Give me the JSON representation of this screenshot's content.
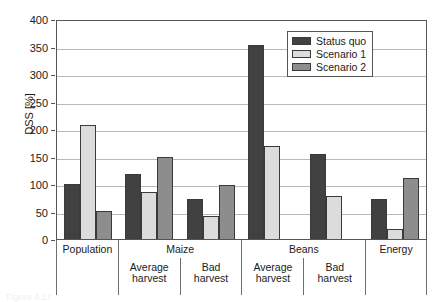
{
  "chart_data": {
    "type": "bar",
    "title": "",
    "xlabel": "",
    "ylabel": "DSS [%]",
    "ylim": [
      0,
      400
    ],
    "yticks": [
      0,
      50,
      100,
      150,
      200,
      250,
      300,
      350,
      400
    ],
    "ytick_labels": [
      "0",
      "50",
      "100",
      "150",
      "200",
      "250",
      "300",
      "350",
      "400"
    ],
    "grid": true,
    "legend_position": "top-right",
    "categories": [
      "Population",
      "Maize – Average harvest",
      "Maize – Bad harvest",
      "Beans – Average harvest",
      "Beans – Bad harvest",
      "Energy"
    ],
    "group_headers": [
      {
        "label": "Population",
        "span": 1
      },
      {
        "label": "Maize",
        "span": 2
      },
      {
        "label": "Beans",
        "span": 2
      },
      {
        "label": "Energy",
        "span": 1
      }
    ],
    "sub_labels": [
      {
        "line1": "",
        "line2": ""
      },
      {
        "line1": "Average",
        "line2": "harvest"
      },
      {
        "line1": "Bad",
        "line2": "harvest"
      },
      {
        "line1": "Average",
        "line2": "harvest"
      },
      {
        "line1": "Bad",
        "line2": "harvest"
      },
      {
        "line1": "",
        "line2": ""
      }
    ],
    "series": [
      {
        "name": "Status quo",
        "color": "#414141",
        "values": [
          100,
          119,
          72,
          352,
          155,
          72
        ]
      },
      {
        "name": "Scenario 1",
        "color": "#dcdcdc",
        "values": [
          208,
          85,
          41,
          169,
          78,
          18
        ]
      },
      {
        "name": "Scenario 2",
        "color": "#8d8d8d",
        "values": [
          51,
          149,
          99,
          null,
          null,
          111
        ]
      }
    ]
  },
  "legend": {
    "items": [
      {
        "label": "Status quo",
        "color": "#414141"
      },
      {
        "label": "Scenario 1",
        "color": "#dcdcdc"
      },
      {
        "label": "Scenario 2",
        "color": "#8d8d8d"
      }
    ]
  },
  "axis": {
    "y_title": "DSS [%]",
    "ticks": [
      "400",
      "350",
      "300",
      "250",
      "200",
      "150",
      "100",
      "50",
      "0"
    ]
  },
  "caption": "Figure 4.17",
  "colors": {
    "status_quo": "#414141",
    "scenario_1": "#dcdcdc",
    "scenario_2": "#8d8d8d",
    "grid": "#b9b9b9",
    "frame": "#555555",
    "text": "#1a1a1a"
  }
}
